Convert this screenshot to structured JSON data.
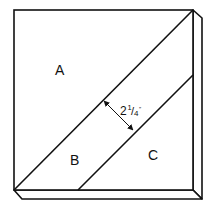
{
  "diagram": {
    "type": "beveled square board cut into three strips",
    "colors": {
      "stroke": "#111111",
      "background": "#ffffff"
    },
    "regions": [
      {
        "id": "A",
        "label": "A"
      },
      {
        "id": "B",
        "label": "B"
      },
      {
        "id": "C",
        "label": "C"
      }
    ],
    "dimension": {
      "whole": "2",
      "numerator": "1",
      "slash": "/",
      "denominator": "4",
      "unit": "″",
      "meaning": "width of strip B measured perpendicular to the diagonal cuts"
    }
  }
}
